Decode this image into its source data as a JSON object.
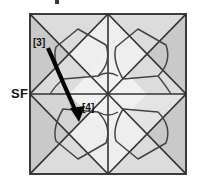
{
  "figure": {
    "title_fragment": "",
    "frame": {
      "x": 30,
      "y": 14,
      "width": 156,
      "height": 160
    },
    "colors": {
      "line": "#333333",
      "frame_border": "#2a2a2a",
      "shade_dark": "#c9c9c9",
      "shade_mid": "#dcdcdc",
      "shade_light": "#eeeeee",
      "background": "#ffffff",
      "arrow": "#000000",
      "text": "#111111"
    },
    "labels": {
      "sf": "SF",
      "node_3": "[3]",
      "node_4": "[4]"
    },
    "arrow": {
      "from_label": "[3]",
      "to_label": "[4]",
      "start_x": 48,
      "start_y": 48,
      "end_x": 79,
      "end_y": 121
    },
    "geometry": {
      "quadrants": 4,
      "per_quadrant_elements": [
        "diagonal-cross",
        "rotated-polygon-loop"
      ],
      "center_x": 108,
      "center_y": 94
    }
  }
}
